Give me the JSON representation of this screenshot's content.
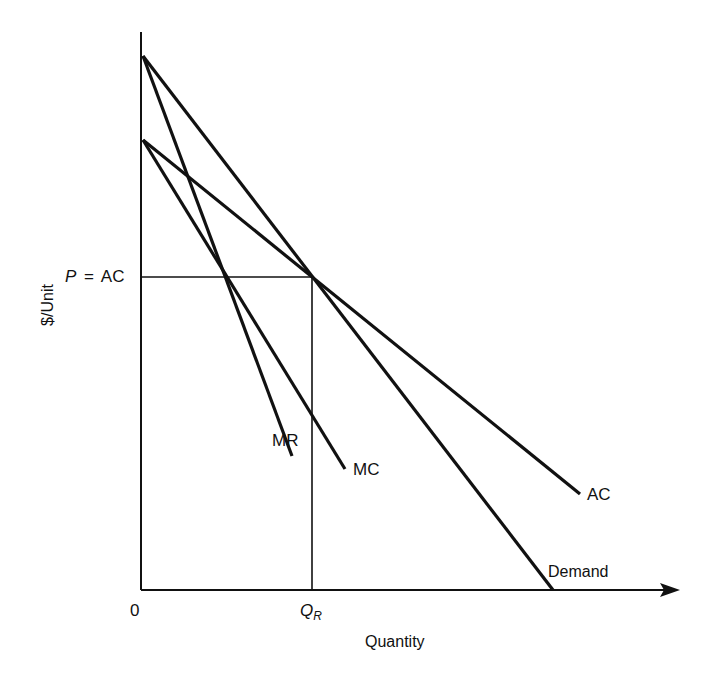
{
  "diagram": {
    "type": "economics-monopoly-pricing",
    "axes": {
      "y_label": "$/Unit",
      "x_label": "Quantity",
      "origin_label": "0"
    },
    "price_label": {
      "p": "P",
      "eq": "=",
      "ac": "AC"
    },
    "quantity_label": {
      "q": "Q",
      "sub": "R"
    },
    "curves": [
      {
        "name": "Demand",
        "label": "Demand"
      },
      {
        "name": "MR",
        "label": "MR"
      },
      {
        "name": "MC",
        "label": "MC"
      },
      {
        "name": "AC",
        "label": "AC"
      }
    ],
    "colors": {
      "line": "#111111",
      "background": "#ffffff"
    }
  }
}
